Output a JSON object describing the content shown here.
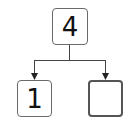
{
  "diagram": {
    "type": "number-bond",
    "whole": "4",
    "parts": [
      {
        "label": "1"
      },
      {
        "label": ""
      }
    ],
    "colors": {
      "line": "#444444",
      "box_border": "#6a6a6a",
      "text": "#111111"
    }
  }
}
